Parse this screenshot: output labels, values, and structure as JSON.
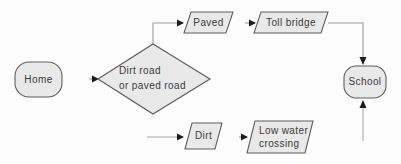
{
  "diagram": {
    "type": "flowchart",
    "nodes": {
      "home": {
        "label": "Home",
        "shape": "rounded-rectangle"
      },
      "decision": {
        "label": "Dirt road\nor paved road",
        "shape": "diamond"
      },
      "paved": {
        "label": "Paved",
        "shape": "parallelogram"
      },
      "toll_bridge": {
        "label": "Toll bridge",
        "shape": "parallelogram"
      },
      "dirt": {
        "label": "Dirt",
        "shape": "parallelogram"
      },
      "low_water_crossing": {
        "label": "Low water\ncrossing",
        "shape": "parallelogram"
      },
      "school": {
        "label": "School",
        "shape": "rounded-rectangle"
      }
    },
    "edges": [
      {
        "from": "home",
        "to": "decision"
      },
      {
        "from": "decision",
        "to": "paved"
      },
      {
        "from": "paved",
        "to": "toll_bridge"
      },
      {
        "from": "toll_bridge",
        "to": "school"
      },
      {
        "from": "decision",
        "to": "dirt"
      },
      {
        "from": "dirt",
        "to": "low_water_crossing"
      },
      {
        "from": "low_water_crossing",
        "to": "school"
      }
    ],
    "colors": {
      "background": "#fdfdfd",
      "node_fill": "#e9e9e9",
      "node_border": "#5f5f5f",
      "connector": "#9b9b9b",
      "arrowhead": "#1c1c1c",
      "text": "#3a3a3a"
    }
  }
}
